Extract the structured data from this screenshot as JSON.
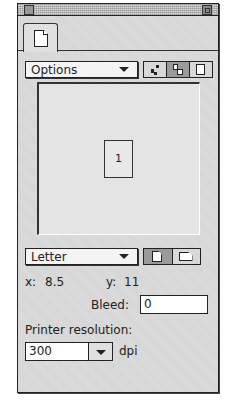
{
  "window": {
    "title": ""
  },
  "tabs": [
    {
      "icon": "document-icon",
      "selected": true
    }
  ],
  "options_menu": {
    "label": "Options",
    "layout_buttons": [
      {
        "icon": "scatter-pages-icon",
        "active": false
      },
      {
        "icon": "stacked-pages-icon",
        "active": true
      },
      {
        "icon": "single-page-icon",
        "active": false
      }
    ]
  },
  "preview": {
    "page_number": "1"
  },
  "paper_size": {
    "selected": "Letter",
    "orientation_buttons": [
      {
        "icon": "portrait-icon",
        "active": true
      },
      {
        "icon": "landscape-icon",
        "active": false
      }
    ]
  },
  "dimensions": {
    "x_label": "x:",
    "x_value": "8.5",
    "y_label": "y:",
    "y_value": "11"
  },
  "bleed": {
    "label": "Bleed:",
    "value": "0"
  },
  "printer_resolution": {
    "label": "Printer resolution:",
    "value": "300",
    "unit": "dpi"
  }
}
